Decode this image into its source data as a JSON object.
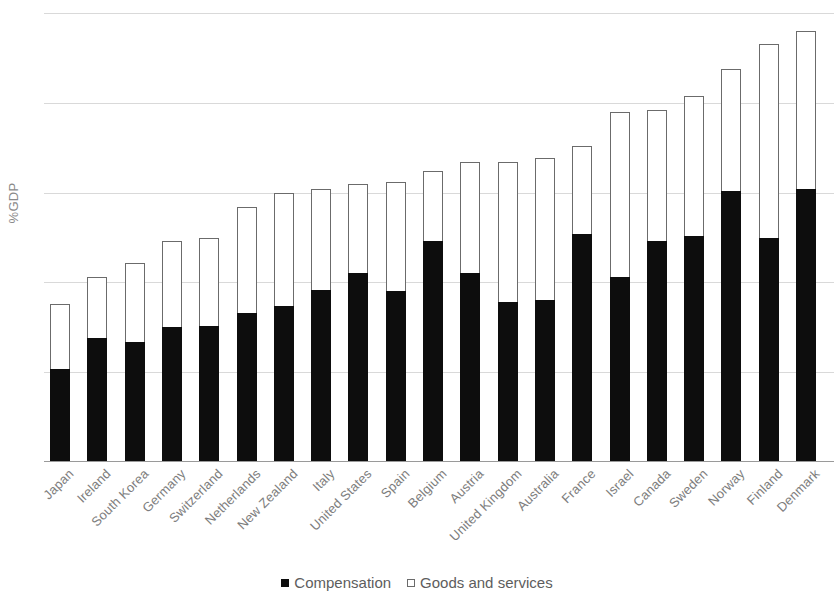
{
  "chart_data": {
    "type": "bar",
    "stacked": true,
    "title": "",
    "subtitle": "",
    "xlabel": "",
    "ylabel": "%GDP",
    "ylim": [
      0,
      25
    ],
    "yticks": [
      0,
      5,
      10,
      15,
      20,
      25
    ],
    "ytick_labels": [
      "0",
      "5",
      "10",
      "15",
      "20",
      "25"
    ],
    "grid": true,
    "legend_position": "bottom",
    "categories": [
      "Japan",
      "Ireland",
      "South Korea",
      "Germany",
      "Switzerland",
      "Netherlands",
      "New Zealand",
      "Italy",
      "United States",
      "Spain",
      "Belgium",
      "Austria",
      "United Kingdom",
      "Australia",
      "France",
      "Israel",
      "Canada",
      "Sweden",
      "Norway",
      "Finland",
      "Denmark"
    ],
    "series": [
      {
        "name": "Compensation",
        "color": "#0d0d0d",
        "values": [
          5.2,
          6.9,
          6.7,
          7.5,
          7.6,
          8.3,
          8.7,
          9.6,
          10.5,
          9.5,
          12.3,
          10.5,
          8.9,
          9.0,
          12.7,
          10.3,
          12.3,
          12.6,
          15.1,
          12.5,
          15.2
        ]
      },
      {
        "name": "Goods and services",
        "color": "#ffffff",
        "values": [
          3.6,
          3.4,
          4.4,
          4.8,
          4.9,
          5.9,
          6.3,
          5.6,
          5.0,
          6.1,
          3.9,
          6.2,
          7.8,
          7.9,
          4.9,
          9.2,
          7.3,
          7.8,
          6.8,
          10.8,
          8.8
        ]
      }
    ],
    "totals": [
      8.8,
      10.3,
      11.1,
      12.3,
      12.5,
      14.2,
      15.0,
      15.2,
      15.5,
      15.6,
      16.2,
      16.7,
      16.7,
      16.9,
      17.6,
      19.5,
      19.6,
      20.4,
      21.9,
      23.3,
      24.0
    ]
  },
  "legend": {
    "items": [
      {
        "label": "Compensation",
        "marker": "filled-square-icon"
      },
      {
        "label": "Goods and services",
        "marker": "hollow-square-icon"
      }
    ]
  }
}
